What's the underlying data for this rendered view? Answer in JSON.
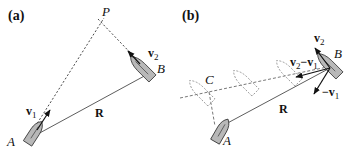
{
  "figure": {
    "panel_a": {
      "label": "(a)",
      "point_P": "P",
      "ship_A": "A",
      "ship_B": "B",
      "velocity_1": {
        "base": "v",
        "sub": "1"
      },
      "velocity_2": {
        "base": "v",
        "sub": "2"
      },
      "separation": "R"
    },
    "panel_b": {
      "label": "(b)",
      "point_C": "C",
      "ship_A": "A",
      "ship_B": "B",
      "velocity_2": {
        "base": "v",
        "sub": "2"
      },
      "relative_velocity": {
        "base1": "v",
        "sub1": "2",
        "minus": "−",
        "base2": "v",
        "sub2": "1"
      },
      "neg_velocity_1": {
        "minus": "−",
        "base": "v",
        "sub": "1"
      },
      "separation": "R"
    },
    "colors": {
      "ship_fill": "#b8b8b8",
      "ink": "#111111",
      "ghost": "#8a8a8a"
    }
  }
}
